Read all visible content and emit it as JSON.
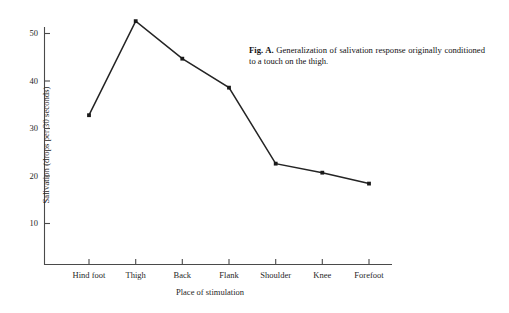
{
  "figure": {
    "caption_lead": "Fig. A.",
    "caption_text": "Generalization of salivation response originally conditioned to a touch on the thigh."
  },
  "chart_data": {
    "type": "line",
    "title": "",
    "subtitle": "",
    "xlabel": "Place of stimulation",
    "ylabel": "Salivation (drops per 30 seconds)",
    "categories": [
      "Hind foot",
      "Thigh",
      "Back",
      "Flank",
      "Shoulder",
      "Knee",
      "Forefoot"
    ],
    "values": [
      32.8,
      52.6,
      44.7,
      38.6,
      22.6,
      20.7,
      18.4
    ],
    "series": [
      {
        "name": "Salivation",
        "values": [
          32.8,
          52.6,
          44.7,
          38.6,
          22.6,
          20.7,
          18.4
        ]
      }
    ],
    "ytick_labels": [
      "50",
      "40",
      "30",
      "20",
      "10"
    ],
    "ytick_values": [
      50,
      40,
      30,
      20,
      10
    ],
    "ylim": [
      0,
      55
    ],
    "grid": false,
    "legend": "none",
    "marker": "square",
    "line_color": "#242424",
    "marker_color": "#1a1a1a",
    "axis_color": "#4a4a4a"
  }
}
